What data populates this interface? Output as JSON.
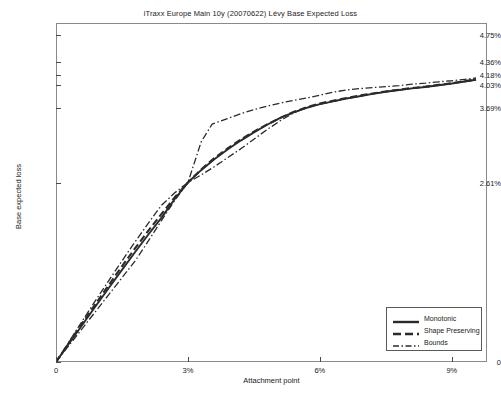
{
  "figure": {
    "width": 501,
    "height": 393,
    "background": "#ffffff",
    "line_color": "#2b2b2b",
    "axis_color": "#8a8a8a"
  },
  "chart_data": {
    "type": "line",
    "title": "iTraxx Europe Main 10y (20070622) Lévy Base Expected Loss",
    "xlabel": "Attachment point",
    "ylabel": "Base expected loss",
    "xlim": [
      0,
      9.8
    ],
    "ylim": [
      0,
      4.93
    ],
    "grid": false,
    "legend_position": "lower right",
    "xticks": [
      0,
      3,
      6,
      9
    ],
    "xticklabels": [
      "0",
      "3%",
      "6%",
      "9%"
    ],
    "yticks": [
      0,
      2.61,
      3.69,
      4.03,
      4.18,
      4.36,
      4.75
    ],
    "yticklabels": [
      "0",
      "2.61%",
      "3.69%",
      "4.03%",
      "4.18%",
      "4.36%",
      "4.75%"
    ],
    "series": [
      {
        "name": "Monotonic",
        "style": "solid",
        "x": [
          0,
          0.3,
          0.6,
          0.9,
          1.2,
          1.5,
          1.8,
          2.1,
          2.4,
          2.7,
          3.0,
          3.3,
          3.6,
          3.9,
          4.2,
          4.5,
          4.8,
          5.1,
          5.4,
          5.7,
          6.0,
          6.3,
          6.6,
          6.9,
          7.2,
          7.5,
          7.8,
          8.1,
          8.4,
          8.7,
          9.0,
          9.3,
          9.55
        ],
        "y": [
          0,
          0.272,
          0.542,
          0.81,
          1.076,
          1.34,
          1.6,
          1.855,
          2.1,
          2.37,
          2.61,
          2.79,
          2.95,
          3.09,
          3.22,
          3.34,
          3.45,
          3.55,
          3.63,
          3.695,
          3.75,
          3.79,
          3.83,
          3.865,
          3.9,
          3.93,
          3.955,
          3.98,
          4.0,
          4.025,
          4.05,
          4.08,
          4.105
        ]
      },
      {
        "name": "Shape Preserving",
        "style": "dashed",
        "x": [
          0,
          0.3,
          0.6,
          0.9,
          1.2,
          1.5,
          1.8,
          2.1,
          2.4,
          2.7,
          3.0,
          3.3,
          3.6,
          3.9,
          4.2,
          4.5,
          4.8,
          5.1,
          5.4,
          5.7,
          6.0,
          6.3,
          6.6,
          6.9,
          7.2,
          7.5,
          7.8,
          8.1,
          8.4,
          8.7,
          9.0,
          9.3,
          9.55
        ],
        "y": [
          0,
          0.285,
          0.567,
          0.845,
          1.12,
          1.392,
          1.655,
          1.91,
          2.155,
          2.395,
          2.61,
          2.8,
          2.965,
          3.105,
          3.235,
          3.35,
          3.455,
          3.55,
          3.635,
          3.705,
          3.76,
          3.8,
          3.84,
          3.875,
          3.905,
          3.935,
          3.96,
          3.985,
          4.005,
          4.03,
          4.055,
          4.085,
          4.11
        ]
      },
      {
        "name": "Bounds",
        "style": "dashdot",
        "is_upper": true,
        "x": [
          0,
          0.3,
          0.6,
          0.9,
          1.2,
          1.5,
          1.8,
          2.1,
          2.4,
          2.7,
          3.0,
          3.3,
          3.55,
          3.9,
          4.2,
          4.5,
          4.8,
          5.1,
          5.4,
          5.7,
          6.0,
          6.3,
          6.6,
          6.9,
          7.2,
          7.5,
          7.8,
          8.1,
          8.4,
          8.7,
          9.0,
          9.3,
          9.55
        ],
        "y": [
          0,
          0.3,
          0.6,
          0.895,
          1.185,
          1.47,
          1.75,
          2.02,
          2.28,
          2.46,
          2.61,
          3.2,
          3.46,
          3.54,
          3.61,
          3.67,
          3.72,
          3.765,
          3.805,
          3.84,
          3.88,
          3.925,
          3.955,
          3.975,
          3.99,
          4.005,
          4.02,
          4.04,
          4.055,
          4.075,
          4.09,
          4.11,
          4.13
        ]
      },
      {
        "name": "Bounds",
        "style": "dashdot",
        "is_lower": true,
        "x": [
          0,
          0.3,
          0.6,
          0.9,
          1.2,
          1.5,
          1.8,
          2.1,
          2.4,
          2.7,
          3.0,
          3.3,
          3.6,
          3.9,
          4.2,
          4.5,
          4.8,
          5.1,
          5.4,
          5.7,
          6.0,
          6.3,
          6.6,
          6.9,
          7.2,
          7.5,
          7.8,
          8.1,
          8.4,
          8.7,
          9.0,
          9.3,
          9.55
        ],
        "y": [
          0,
          0.245,
          0.49,
          0.735,
          0.98,
          1.225,
          1.47,
          1.76,
          2.06,
          2.35,
          2.61,
          2.72,
          2.84,
          2.97,
          3.1,
          3.24,
          3.38,
          3.51,
          3.62,
          3.7,
          3.75,
          3.79,
          3.83,
          3.865,
          3.9,
          3.93,
          3.955,
          3.98,
          4.0,
          4.025,
          4.05,
          4.08,
          4.105
        ]
      }
    ]
  },
  "legend": {
    "entries": [
      {
        "label": "Monotonic",
        "style": "solid"
      },
      {
        "label": "Shape Preserving",
        "style": "dashed"
      },
      {
        "label": "Bounds",
        "style": "dashdot"
      }
    ]
  }
}
